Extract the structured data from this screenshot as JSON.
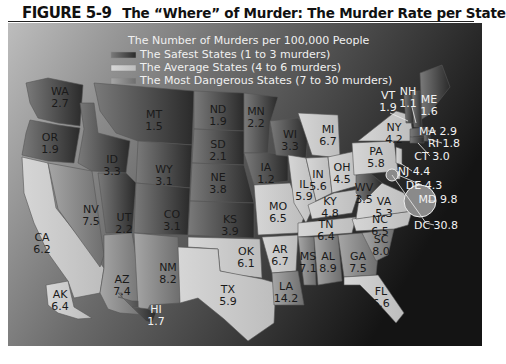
{
  "figure": {
    "number": "FIGURE 5-9",
    "caption": "The “Where” of Murder: The Murder Rate per State"
  },
  "legend": {
    "title": "The Number of Murders per 100,000 People",
    "items": [
      {
        "label": "The Safest States (1 to 3 murders)",
        "color": "#444444"
      },
      {
        "label": "The Average States (4 to 6 murders)",
        "color": "#cfcfcf"
      },
      {
        "label": "The Most Dangerous States (7 to 30 murders)",
        "color": "#8a8a8a"
      }
    ]
  },
  "chart_data": {
    "type": "choropleth",
    "title": "The “Where” of Murder: The Murder Rate per State",
    "metric": "Murders per 100,000 people",
    "categories": [
      {
        "name": "Safest",
        "range": [
          1,
          3
        ]
      },
      {
        "name": "Average",
        "range": [
          4,
          6
        ]
      },
      {
        "name": "Most Dangerous",
        "range": [
          7,
          30
        ]
      }
    ],
    "states": [
      {
        "abbr": "WA",
        "value": "2.7"
      },
      {
        "abbr": "OR",
        "value": "1.9"
      },
      {
        "abbr": "CA",
        "value": "6.2"
      },
      {
        "abbr": "NV",
        "value": "7.5"
      },
      {
        "abbr": "ID",
        "value": "3.3"
      },
      {
        "abbr": "MT",
        "value": "1.5"
      },
      {
        "abbr": "WY",
        "value": "3.1"
      },
      {
        "abbr": "UT",
        "value": "2.2"
      },
      {
        "abbr": "CO",
        "value": "3.1"
      },
      {
        "abbr": "AZ",
        "value": "7.4"
      },
      {
        "abbr": "NM",
        "value": "8.2"
      },
      {
        "abbr": "ND",
        "value": "1.9"
      },
      {
        "abbr": "SD",
        "value": "2.1"
      },
      {
        "abbr": "NE",
        "value": "3.8"
      },
      {
        "abbr": "KS",
        "value": "3.9"
      },
      {
        "abbr": "OK",
        "value": "6.1"
      },
      {
        "abbr": "TX",
        "value": "5.9"
      },
      {
        "abbr": "MN",
        "value": "2.2"
      },
      {
        "abbr": "IA",
        "value": "1.2"
      },
      {
        "abbr": "MO",
        "value": "6.5"
      },
      {
        "abbr": "AR",
        "value": "6.7"
      },
      {
        "abbr": "LA",
        "value": "14.2"
      },
      {
        "abbr": "WI",
        "value": "3.3"
      },
      {
        "abbr": "IL",
        "value": "5.9"
      },
      {
        "abbr": "MI",
        "value": "6.7"
      },
      {
        "abbr": "IN",
        "value": "5.6"
      },
      {
        "abbr": "OH",
        "value": "4.5"
      },
      {
        "abbr": "KY",
        "value": "4.8"
      },
      {
        "abbr": "TN",
        "value": "6.4"
      },
      {
        "abbr": "MS",
        "value": "7.1"
      },
      {
        "abbr": "AL",
        "value": "8.9"
      },
      {
        "abbr": "GA",
        "value": "7.5"
      },
      {
        "abbr": "FL",
        "value": "6.6"
      },
      {
        "abbr": "SC",
        "value": "8.0"
      },
      {
        "abbr": "NC",
        "value": "6.5"
      },
      {
        "abbr": "VA",
        "value": "5.3"
      },
      {
        "abbr": "WV",
        "value": "3.5"
      },
      {
        "abbr": "PA",
        "value": "5.8"
      },
      {
        "abbr": "NY",
        "value": "4.2"
      },
      {
        "abbr": "VT",
        "value": "1.9"
      },
      {
        "abbr": "NH",
        "value": "1.1"
      },
      {
        "abbr": "ME",
        "value": "1.6"
      },
      {
        "abbr": "MA",
        "value": "2.9"
      },
      {
        "abbr": "RI",
        "value": "1.8"
      },
      {
        "abbr": "CT",
        "value": "3.0"
      },
      {
        "abbr": "NJ",
        "value": "4.4"
      },
      {
        "abbr": "DE",
        "value": "4.3"
      },
      {
        "abbr": "MD",
        "value": "9.8"
      },
      {
        "abbr": "DC",
        "value": "30.8"
      },
      {
        "abbr": "AK",
        "value": "6.4"
      },
      {
        "abbr": "HI",
        "value": "1.7"
      }
    ]
  }
}
